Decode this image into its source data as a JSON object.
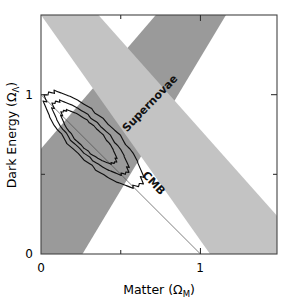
{
  "figure": {
    "title": "",
    "background_color": "#ffffff"
  },
  "chart_data": {
    "type": "scatter",
    "title": "",
    "subtitle": "",
    "xlabel": "Matter (Ω",
    "xlabel_sub": "M",
    "xlabel_tail": ")",
    "ylabel": "Dark Energy (Ω",
    "ylabel_sub": "Λ",
    "ylabel_tail": ")",
    "xlim": [
      0,
      1.48
    ],
    "ylim": [
      0,
      1.5
    ],
    "xticks": [
      0,
      0.5,
      1
    ],
    "xtick_labels": [
      "0",
      "",
      "1"
    ],
    "yticks": [
      0,
      0.5,
      1
    ],
    "ytick_labels": [
      "0",
      "",
      "1"
    ],
    "grid": false,
    "legend_position": "in-plot-rotated-labels",
    "annotations": [
      {
        "name": "supernovae-label",
        "text": "Supernovae",
        "x": 0.7,
        "y": 0.93,
        "rotation": -46,
        "color": "#111111"
      },
      {
        "name": "cmb-label",
        "text": "CMB",
        "x": 0.69,
        "y": 0.43,
        "rotation": 47,
        "color": "#111111"
      }
    ],
    "bands": [
      {
        "name": "supernovae-band",
        "label": "Supernovae",
        "color": "#9a9a9a",
        "description": "Degeneracy band from Type Ia supernovae, running lower-left to upper-right (constrains approx. 0.8*Omega_M - Omega_Lambda)",
        "polygon": [
          [
            0.0,
            0.66
          ],
          [
            0.72,
            1.5
          ],
          [
            1.16,
            1.5
          ],
          [
            0.26,
            0.0
          ],
          [
            0.0,
            0.0
          ]
        ]
      },
      {
        "name": "cmb-band",
        "label": "CMB",
        "color": "#c3c3c3",
        "description": "Degeneracy band from CMB acoustic peak, running upper-left to lower-right (constrains Omega_M + Omega_Lambda ~ 1)",
        "polygon": [
          [
            0.0,
            1.5
          ],
          [
            0.36,
            1.5
          ],
          [
            1.48,
            0.24
          ],
          [
            1.48,
            0.0
          ],
          [
            1.06,
            0.0
          ]
        ]
      }
    ],
    "lines": [
      {
        "name": "flat-universe-line",
        "label": "",
        "description": "Flat universe: Omega_M + Omega_Lambda = 1",
        "x": [
          0.0,
          1.0
        ],
        "y": [
          1.0,
          0.0
        ],
        "color": "#4a4a4a"
      }
    ],
    "contours": [
      {
        "name": "confidence-contour-outer",
        "level": "outer",
        "center": [
          0.33,
          0.72
        ],
        "semi_major": 0.4,
        "semi_minor": 0.135,
        "angle_deg": -44
      },
      {
        "name": "confidence-contour-middle",
        "level": "middle",
        "center": [
          0.31,
          0.73
        ],
        "semi_major": 0.31,
        "semi_minor": 0.098,
        "angle_deg": -44
      },
      {
        "name": "confidence-contour-inner",
        "level": "inner",
        "center": [
          0.3,
          0.735
        ],
        "semi_major": 0.225,
        "semi_minor": 0.072,
        "angle_deg": -44
      }
    ]
  },
  "axes": {
    "x_label_text": "Matter (ΩM)",
    "y_label_text": "Dark Energy (ΩΛ)",
    "x_tick_0": "0",
    "x_tick_1": "1",
    "y_tick_0": "0",
    "y_tick_1": "1"
  }
}
